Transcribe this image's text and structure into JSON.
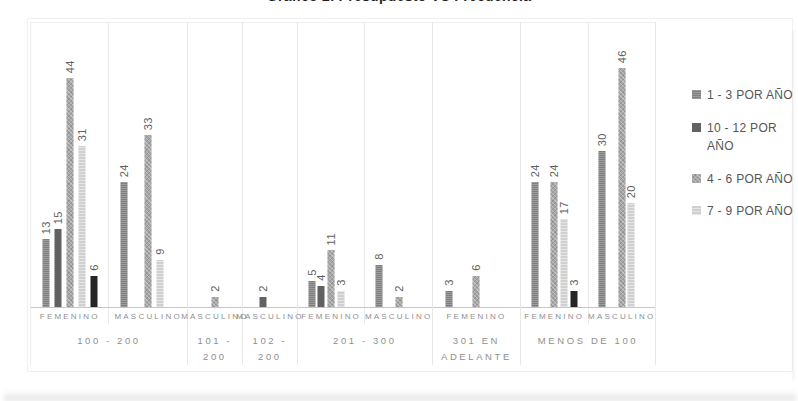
{
  "chart_data": {
    "type": "bar",
    "title": "Gráfico 2. Presupuesto VS Frecuencia",
    "ylabel": "",
    "xlabel": "",
    "ylim": [
      0,
      50
    ],
    "legend_position": "right",
    "value_labels": "rotated 90° above each bar",
    "series": [
      {
        "id": "s1",
        "label": "1 - 3 POR AÑO",
        "color": "#7f7f7f",
        "texture": "fine",
        "in_legend": true
      },
      {
        "id": "s2",
        "label": "10 - 12 POR AÑO",
        "color": "#616161",
        "texture": "solid",
        "in_legend": true
      },
      {
        "id": "s3",
        "label": "4 - 6 POR AÑO",
        "color": "#a6a6a6",
        "texture": "checker",
        "in_legend": true
      },
      {
        "id": "s4",
        "label": "7 - 9 POR AÑO",
        "color": "#d0d0d0",
        "texture": "stripes",
        "in_legend": true
      },
      {
        "id": "s5",
        "label": "",
        "color": "#262626",
        "texture": "solid",
        "in_legend": false
      }
    ],
    "groups": [
      {
        "range": "100 - 200",
        "subgroups": [
          {
            "gender": "FEMENINO",
            "bars": [
              {
                "slot": 1,
                "series": "s1",
                "value": 13
              },
              {
                "slot": 2,
                "series": "s2",
                "value": 15
              },
              {
                "slot": 3,
                "series": "s3",
                "value": 44
              },
              {
                "slot": 4,
                "series": "s4",
                "value": 31
              },
              {
                "slot": 5,
                "series": "s5",
                "value": 6
              }
            ]
          },
          {
            "gender": "MASCULINO",
            "bars": [
              {
                "slot": 1,
                "series": "s1",
                "value": 24
              },
              {
                "slot": 3,
                "series": "s3",
                "value": 33
              },
              {
                "slot": 4,
                "series": "s4",
                "value": 9
              }
            ]
          }
        ]
      },
      {
        "range": "101 - 200",
        "subgroups": [
          {
            "gender": "MASCULINO",
            "bars": [
              {
                "slot": 3,
                "series": "s3",
                "value": 2
              }
            ]
          }
        ]
      },
      {
        "range": "102 - 200",
        "subgroups": [
          {
            "gender": "MASCULINO",
            "bars": [
              {
                "slot": 2,
                "series": "s2",
                "value": 2
              }
            ]
          }
        ]
      },
      {
        "range": "201 - 300",
        "subgroups": [
          {
            "gender": "FEMENINO",
            "bars": [
              {
                "slot": 1,
                "series": "s1",
                "value": 5
              },
              {
                "slot": 2,
                "series": "s2",
                "value": 4
              },
              {
                "slot": 3,
                "series": "s3",
                "value": 11
              },
              {
                "slot": 4,
                "series": "s4",
                "value": 3
              }
            ]
          },
          {
            "gender": "MASCULINO",
            "bars": [
              {
                "slot": 1,
                "series": "s1",
                "value": 8
              },
              {
                "slot": 3,
                "series": "s3",
                "value": 2
              }
            ]
          }
        ]
      },
      {
        "range": "301 EN ADELANTE",
        "subgroups": [
          {
            "gender": "FEMENINO",
            "bars": [
              {
                "slot": 1,
                "series": "s1",
                "value": 3
              },
              {
                "slot": 3,
                "series": "s3",
                "value": 6
              }
            ]
          }
        ]
      },
      {
        "range": "MENOS DE 100",
        "subgroups": [
          {
            "gender": "FEMENINO",
            "bars": [
              {
                "slot": 1,
                "series": "s1",
                "value": 24
              },
              {
                "slot": 3,
                "series": "s3",
                "value": 24
              },
              {
                "slot": 4,
                "series": "s4",
                "value": 17
              },
              {
                "slot": 5,
                "series": "s5",
                "value": 3
              }
            ]
          },
          {
            "gender": "MASCULINO",
            "bars": [
              {
                "slot": 1,
                "series": "s1",
                "value": 30
              },
              {
                "slot": 3,
                "series": "s3",
                "value": 46
              },
              {
                "slot": 4,
                "series": "s4",
                "value": 20
              }
            ]
          }
        ]
      }
    ]
  }
}
